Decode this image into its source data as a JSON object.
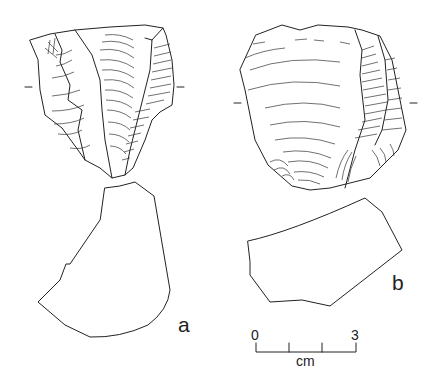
{
  "figure": {
    "artifacts": [
      {
        "id": "a",
        "label": "a"
      },
      {
        "id": "b",
        "label": "b"
      }
    ],
    "scale_bar": {
      "start_label": "0",
      "end_label": "3",
      "unit_label": "cm"
    },
    "colors": {
      "ink": "#222222",
      "background": "#ffffff"
    }
  }
}
